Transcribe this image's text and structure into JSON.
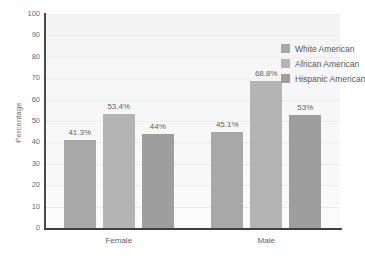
{
  "chart_data": {
    "type": "bar",
    "title": "",
    "subtitle": "",
    "xlabel": "",
    "ylabel": "Percentage",
    "ylim": [
      0,
      100
    ],
    "ytick_step": 10,
    "yticks": [
      100,
      90,
      80,
      70,
      60,
      50,
      40,
      30,
      20,
      10,
      0
    ],
    "ytick_labels": [
      "100",
      "90",
      "80",
      "70",
      "60",
      "50",
      "40",
      "30",
      "20",
      "10",
      "0"
    ],
    "categories": [
      "Female",
      "Male"
    ],
    "grid": true,
    "grid_axis": "y",
    "legend_position": "top-right-inside",
    "series": [
      {
        "name": "White American",
        "color": "#a8a8a8",
        "values": [
          41.3,
          45.1
        ],
        "labels": [
          "41.3%",
          "45.1%"
        ]
      },
      {
        "name": "African American",
        "color": "#b4b4b4",
        "values": [
          53.4,
          68.8
        ],
        "labels": [
          "53.4%",
          "68.8%"
        ]
      },
      {
        "name": "Hispanic American",
        "color": "#9e9e9e",
        "values": [
          44,
          53
        ],
        "labels": [
          "44%",
          "53%"
        ]
      }
    ]
  },
  "colors": {
    "plot_background": "#f7f7f7",
    "page_background": "#ffffff",
    "axis_line": "#3f3f3f",
    "gridline": "#ededed",
    "text": "#5f5f5f",
    "bar_white_american": "#a8a8a8",
    "bar_african_american": "#b4b4b4",
    "bar_hispanic_american": "#9e9e9e"
  }
}
